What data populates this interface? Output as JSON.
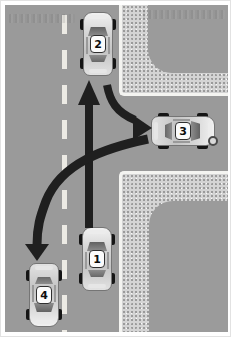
{
  "diagram": {
    "name": "traffic-intersection-scenario",
    "cars": [
      {
        "label": "1",
        "heading": "up",
        "position": "main-road-bottom-center"
      },
      {
        "label": "2",
        "heading": "up",
        "position": "main-road-top-center"
      },
      {
        "label": "3",
        "heading": "right",
        "position": "side-road-right"
      },
      {
        "label": "4",
        "heading": "down",
        "position": "main-road-bottom-left"
      }
    ],
    "arrows": [
      {
        "name": "straight-ahead-arrow",
        "from": "car-1",
        "to": "behind-car-2",
        "direction": "up"
      },
      {
        "name": "right-turn-arrow",
        "from": "main-road",
        "to": "side-road-toward-car-3",
        "direction": "right"
      },
      {
        "name": "sweep-left-arrow",
        "from": "side-road",
        "to": "oncoming-lane-at-car-4",
        "direction": "down-left"
      }
    ],
    "colors": {
      "road": "#9a9a9a",
      "sidewalk": "#d4d4d4",
      "curb_line": "#f4f4f1",
      "lane_dash": "#eceae4",
      "arrow": "#1f1f1f",
      "car_body": "#d6d6d6",
      "frame": "#ffffff"
    }
  }
}
